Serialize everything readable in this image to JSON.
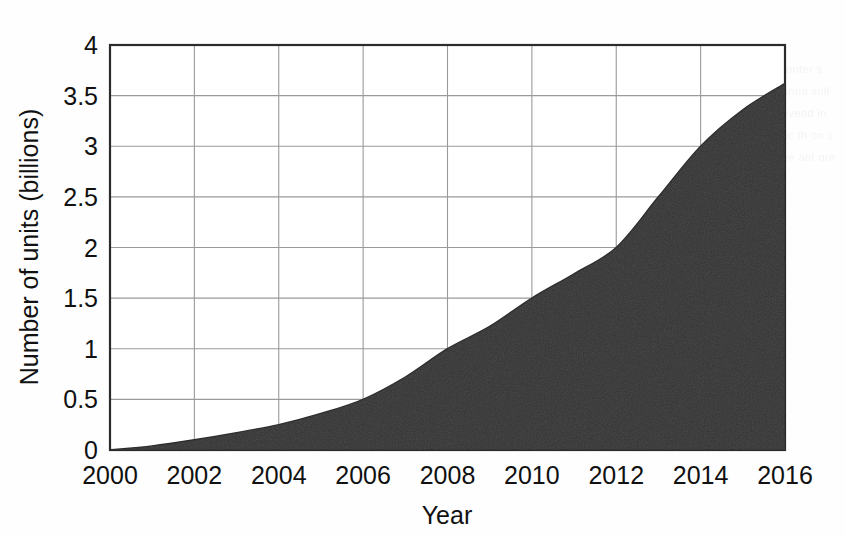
{
  "chart_data": {
    "type": "area",
    "title": "",
    "xlabel": "Year",
    "ylabel": "Number of units (billions)",
    "xlim": [
      2000,
      2016
    ],
    "ylim": [
      0,
      4
    ],
    "grid": true,
    "legend": "none",
    "fill_color": "#333333",
    "grid_color": "#9a9a9a",
    "axis_color": "#2b2b2b",
    "background_color": "#ffffff",
    "x_ticks": [
      "2000",
      "2002",
      "2004",
      "2006",
      "2008",
      "2010",
      "2012",
      "2014",
      "2016"
    ],
    "y_ticks": [
      "0",
      "0.5",
      "1",
      "1.5",
      "2",
      "2.5",
      "3",
      "3.5",
      "4"
    ],
    "x": [
      2000,
      2001,
      2002,
      2003,
      2004,
      2005,
      2006,
      2007,
      2008,
      2009,
      2010,
      2011,
      2012,
      2013,
      2014,
      2015,
      2016
    ],
    "values": [
      0.0,
      0.04,
      0.1,
      0.17,
      0.25,
      0.36,
      0.5,
      0.72,
      1.0,
      1.22,
      1.5,
      1.74,
      2.0,
      2.5,
      3.0,
      3.36,
      3.62
    ],
    "series": [
      {
        "name": "Number of units",
        "values": [
          0.0,
          0.04,
          0.1,
          0.17,
          0.25,
          0.36,
          0.5,
          0.72,
          1.0,
          1.22,
          1.5,
          1.74,
          2.0,
          2.5,
          3.0,
          3.36,
          3.62
        ]
      }
    ]
  },
  "bleed": {
    "lines": "ronter s\nanna\nsull\nevend\nin tic\nth\non s\nee ant ore"
  }
}
